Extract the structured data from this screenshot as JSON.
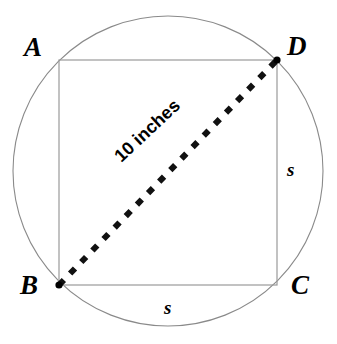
{
  "figure": {
    "background_color": "#ffffff",
    "stroke_color": "#808080",
    "dash_color": "#000000",
    "width": 337,
    "height": 344
  },
  "circle": {
    "name": "circumscribed-circle",
    "center_x": 168,
    "center_y": 171,
    "radius": 155,
    "stroke": "#8a8a8a",
    "stroke_width": 1,
    "fill": "none"
  },
  "square": {
    "name": "inscribed-square",
    "left": 59,
    "top": 60,
    "right": 277,
    "bottom": 285,
    "stroke": "#9a9a9a",
    "stroke_width": 1,
    "fill": "none"
  },
  "diagonal": {
    "name": "diagonal-BD",
    "from": "B",
    "to": "D",
    "x1": 59,
    "y1": 285,
    "x2": 277,
    "y2": 60,
    "style": "dashed",
    "stroke": "#000000",
    "stroke_width": 6,
    "dash_pattern": "7 9",
    "label": "10 inches"
  },
  "vertices": [
    {
      "id": "A",
      "label": "A",
      "x": 59,
      "y": 60,
      "marked": false
    },
    {
      "id": "D",
      "label": "D",
      "x": 277,
      "y": 60,
      "marked": true
    },
    {
      "id": "B",
      "label": "B",
      "x": 59,
      "y": 285,
      "marked": true
    },
    {
      "id": "C",
      "label": "C",
      "x": 277,
      "y": 285,
      "marked": false
    }
  ],
  "side_labels": {
    "right": "s",
    "bottom": "s"
  },
  "measurements": {
    "diagonal_length": "10 inches",
    "side_length_symbol": "s"
  },
  "bottom_cutoff_text": ""
}
